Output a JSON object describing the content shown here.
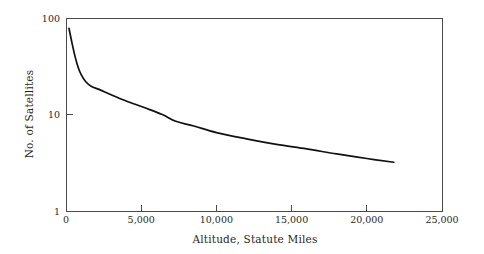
{
  "chart_data": {
    "type": "line",
    "title": "",
    "xlabel": "Altitude, Statute Miles",
    "ylabel": "No. of Satellites",
    "xlim": [
      0,
      25000
    ],
    "ylim": [
      1,
      100
    ],
    "yscale": "log",
    "xscale": "linear",
    "grid": false,
    "legend": null,
    "xticks": [
      0,
      5000,
      10000,
      15000,
      20000,
      25000
    ],
    "xtick_labels": [
      "0",
      "5,000",
      "10,000",
      "15,000",
      "20,000",
      "25,000"
    ],
    "yticks": [
      1,
      10,
      100
    ],
    "ytick_labels": [
      "1",
      "10",
      "100"
    ],
    "series": [
      {
        "name": "Satellites vs Altitude",
        "color": "#111111",
        "x": [
          200,
          400,
          600,
          800,
          1000,
          1300,
          1700,
          2200,
          3000,
          4000,
          5200,
          6400,
          7300,
          8500,
          10000,
          12000,
          14000,
          16000,
          18000,
          20000,
          21800
        ],
        "y": [
          78,
          55,
          40,
          31,
          26,
          22,
          19.5,
          18.2,
          16.0,
          13.8,
          11.8,
          10.0,
          8.5,
          7.6,
          6.5,
          5.6,
          4.9,
          4.4,
          3.9,
          3.5,
          3.2
        ]
      }
    ]
  },
  "figure": {
    "background_color": "#ffffff",
    "axis_color": "#4a4a4a",
    "curve_color": "#111111"
  }
}
